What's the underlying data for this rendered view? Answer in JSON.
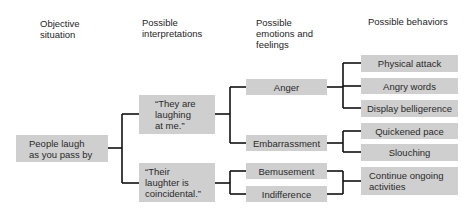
{
  "headers": {
    "objective": "Objective\nsituation",
    "interpretations": "Possible\ninterpretations",
    "emotions": "Possible\nemotions and\nfeelings",
    "behaviors": "Possible behaviors"
  },
  "situation": "People laugh\nas you pass by",
  "interpretations": [
    "“They are\nlaughing\nat me.”",
    "“Their\nlaughter is\ncoincidental.”"
  ],
  "emotions": [
    "Anger",
    "Embarrassment",
    "Bemusement",
    "Indifference"
  ],
  "behaviors": [
    "Physical attack",
    "Angry words",
    "Display belligerence",
    "Quickened pace",
    "Slouching",
    "Continue ongoing\nactivities"
  ],
  "colors": {
    "box_fill": "#cfcfcf",
    "connector": "#111111"
  }
}
